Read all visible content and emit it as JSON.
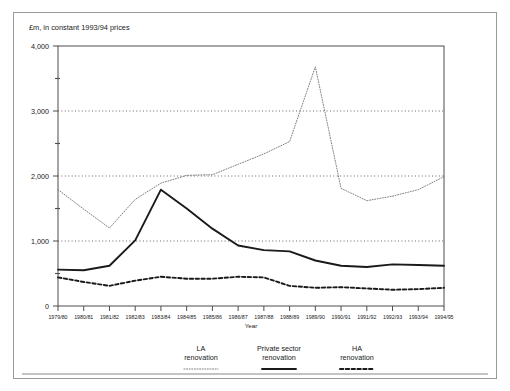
{
  "figure": {
    "axis_title": "£m, in constant 1993/94 prices",
    "xlabel": "Year"
  },
  "legend": {
    "items": [
      {
        "label_line1": "LA",
        "label_line2": "renovation",
        "style": "dotted",
        "color": "#7a7a7a"
      },
      {
        "label_line1": "Private sector",
        "label_line2": "renovation",
        "style": "solid",
        "color": "#1a1a1a"
      },
      {
        "label_line1": "HA",
        "label_line2": "renovation",
        "style": "dashed",
        "color": "#1a1a1a"
      }
    ]
  },
  "chart_data": {
    "type": "line",
    "title": "£m, in constant 1993/94 prices",
    "xlabel": "Year",
    "ylabel": "",
    "ylim": [
      0,
      4000
    ],
    "yticks": [
      0,
      1000,
      2000,
      3000,
      4000
    ],
    "ytick_labels": [
      "0",
      "1,000",
      "2,000",
      "3,000",
      "4,000"
    ],
    "yminor_ticks": [
      500,
      1500,
      2500,
      3500
    ],
    "grid": "horizontal-dotted-at-1000-2000-3000",
    "legend_position": "below-plot",
    "categories": [
      "1979/80",
      "1980/81",
      "1981/82",
      "1982/83",
      "1983/84",
      "1984/85",
      "1985/86",
      "1986/87",
      "1987/88",
      "1988/89",
      "1989/90",
      "1990/91",
      "1991/92",
      "1992/93",
      "1993/94",
      "1994/95"
    ],
    "series": [
      {
        "name": "LA renovation",
        "style": "dotted",
        "color": "#7a7a7a",
        "values": [
          1790,
          1490,
          1200,
          1640,
          1890,
          2010,
          2020,
          2180,
          2340,
          2530,
          3680,
          1810,
          1620,
          1690,
          1790,
          1990
        ]
      },
      {
        "name": "Private sector renovation",
        "style": "solid",
        "color": "#1a1a1a",
        "values": [
          560,
          550,
          620,
          1010,
          1790,
          1500,
          1190,
          930,
          860,
          840,
          700,
          620,
          600,
          640,
          630,
          620
        ]
      },
      {
        "name": "HA renovation",
        "style": "dashed",
        "color": "#1a1a1a",
        "values": [
          440,
          370,
          310,
          390,
          450,
          420,
          420,
          450,
          440,
          310,
          280,
          290,
          270,
          250,
          260,
          280
        ]
      }
    ]
  }
}
